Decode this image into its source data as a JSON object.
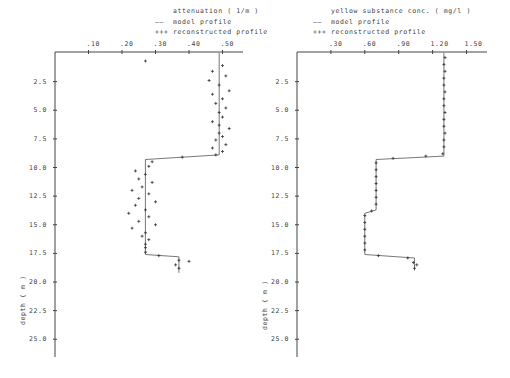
{
  "chart_data": [
    {
      "type": "line",
      "title": "attenuation ( 1/m )",
      "xlabel": "attenuation ( 1/m )",
      "ylabel": "depth ( m )",
      "x_ticks": [
        ".10",
        ".20",
        ".30",
        ".40",
        ".50"
      ],
      "y_ticks": [
        "2.5",
        "5.0",
        "7.5",
        "10.0",
        "12.5",
        "15.0",
        "17.5",
        "20.0",
        "22.5",
        "25.0"
      ],
      "xlim": [
        0.0,
        0.55
      ],
      "ylim": [
        0,
        26.5
      ],
      "y_inverted": true,
      "legend": [
        {
          "symbol": "----",
          "label": "model profile"
        },
        {
          "symbol": "+++",
          "label": "reconstructed profile"
        }
      ],
      "series": [
        {
          "name": "model profile",
          "style": "line",
          "points": [
            [
              0.49,
              0
            ],
            [
              0.49,
              8.9
            ],
            [
              0.27,
              9.3
            ],
            [
              0.27,
              17.6
            ],
            [
              0.37,
              17.8
            ],
            [
              0.37,
              19.2
            ]
          ]
        },
        {
          "name": "reconstructed profile",
          "style": "plus",
          "points": [
            [
              0.27,
              0.7
            ],
            [
              0.5,
              1.1
            ],
            [
              0.47,
              1.6
            ],
            [
              0.51,
              2.0
            ],
            [
              0.46,
              2.4
            ],
            [
              0.49,
              2.8
            ],
            [
              0.52,
              3.3
            ],
            [
              0.47,
              3.6
            ],
            [
              0.5,
              4.0
            ],
            [
              0.48,
              4.4
            ],
            [
              0.51,
              4.8
            ],
            [
              0.49,
              5.2
            ],
            [
              0.5,
              5.6
            ],
            [
              0.47,
              6.0
            ],
            [
              0.49,
              6.3
            ],
            [
              0.52,
              6.6
            ],
            [
              0.49,
              7.0
            ],
            [
              0.5,
              7.3
            ],
            [
              0.48,
              7.6
            ],
            [
              0.51,
              8.0
            ],
            [
              0.47,
              8.3
            ],
            [
              0.5,
              8.6
            ],
            [
              0.48,
              8.9
            ],
            [
              0.38,
              9.1
            ],
            [
              0.29,
              9.5
            ],
            [
              0.28,
              9.9
            ],
            [
              0.24,
              10.3
            ],
            [
              0.27,
              10.6
            ],
            [
              0.25,
              11.0
            ],
            [
              0.29,
              11.3
            ],
            [
              0.26,
              11.7
            ],
            [
              0.23,
              12.0
            ],
            [
              0.28,
              12.3
            ],
            [
              0.25,
              12.7
            ],
            [
              0.3,
              13.0
            ],
            [
              0.24,
              13.3
            ],
            [
              0.27,
              13.7
            ],
            [
              0.22,
              14.0
            ],
            [
              0.28,
              14.3
            ],
            [
              0.25,
              14.7
            ],
            [
              0.3,
              15.0
            ],
            [
              0.23,
              15.3
            ],
            [
              0.27,
              15.7
            ],
            [
              0.26,
              16.0
            ],
            [
              0.28,
              16.3
            ],
            [
              0.27,
              16.7
            ],
            [
              0.27,
              17.0
            ],
            [
              0.27,
              17.4
            ],
            [
              0.31,
              17.7
            ],
            [
              0.37,
              18.1
            ],
            [
              0.4,
              18.2
            ],
            [
              0.36,
              18.5
            ],
            [
              0.37,
              18.8
            ]
          ]
        }
      ]
    },
    {
      "type": "line",
      "title": "yellow substance conc. ( mg/l )",
      "xlabel": "yellow substance conc. ( mg/l )",
      "ylabel": "depth ( m )",
      "x_ticks": [
        ".30",
        ".60",
        ".90",
        "1.20",
        "1.50"
      ],
      "y_ticks": [
        "2.5",
        "5.0",
        "7.5",
        "10.0",
        "12.5",
        "15.0",
        "17.5",
        "20.0",
        "22.5",
        "25.0"
      ],
      "xlim": [
        0.0,
        1.68
      ],
      "ylim": [
        0,
        26.5
      ],
      "y_inverted": true,
      "legend": [
        {
          "symbol": "----",
          "label": "model profile"
        },
        {
          "symbol": "+++",
          "label": "reconstructed profile"
        }
      ],
      "series": [
        {
          "name": "model profile",
          "style": "line",
          "points": [
            [
              1.3,
              0
            ],
            [
              1.3,
              9.0
            ],
            [
              0.7,
              9.3
            ],
            [
              0.7,
              13.7
            ],
            [
              0.6,
              14.0
            ],
            [
              0.6,
              17.6
            ],
            [
              1.04,
              17.9
            ],
            [
              1.04,
              19.0
            ]
          ]
        },
        {
          "name": "reconstructed profile",
          "style": "plus",
          "points": [
            [
              1.31,
              0.4
            ],
            [
              1.3,
              1.0
            ],
            [
              1.31,
              1.6
            ],
            [
              1.3,
              2.2
            ],
            [
              1.3,
              2.8
            ],
            [
              1.31,
              3.4
            ],
            [
              1.3,
              4.0
            ],
            [
              1.3,
              4.6
            ],
            [
              1.31,
              5.2
            ],
            [
              1.3,
              5.8
            ],
            [
              1.3,
              6.4
            ],
            [
              1.31,
              7.0
            ],
            [
              1.3,
              7.6
            ],
            [
              1.3,
              8.2
            ],
            [
              1.29,
              8.8
            ],
            [
              1.14,
              9.0
            ],
            [
              0.85,
              9.2
            ],
            [
              0.7,
              9.6
            ],
            [
              0.7,
              10.2
            ],
            [
              0.7,
              10.8
            ],
            [
              0.7,
              11.4
            ],
            [
              0.7,
              12.0
            ],
            [
              0.7,
              12.6
            ],
            [
              0.7,
              13.2
            ],
            [
              0.66,
              13.8
            ],
            [
              0.6,
              14.2
            ],
            [
              0.6,
              14.8
            ],
            [
              0.6,
              15.4
            ],
            [
              0.6,
              16.0
            ],
            [
              0.6,
              16.6
            ],
            [
              0.6,
              17.2
            ],
            [
              0.72,
              17.7
            ],
            [
              0.98,
              17.9
            ],
            [
              1.03,
              18.3
            ],
            [
              1.06,
              18.5
            ],
            [
              1.04,
              18.8
            ]
          ]
        }
      ]
    }
  ]
}
